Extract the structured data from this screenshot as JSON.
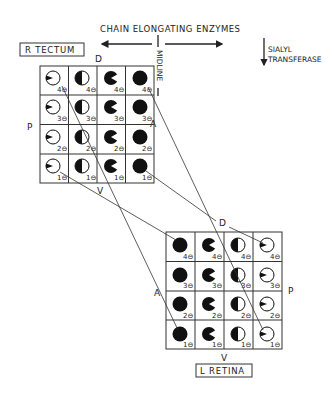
{
  "header": {
    "gradient_label": "CHAIN ELONGATING ENZYMES",
    "midline_label": "MIDLINE",
    "sialyl_label_line1": "SIALYL",
    "sialyl_label_line2": "TRANSFERASE"
  },
  "tectum": {
    "title": "R TECTUM",
    "axis_top": "D",
    "axis_left": "P",
    "axis_right": "A",
    "axis_bottom": "V",
    "rows": [
      "4⊖",
      "3⊖",
      "2⊖",
      "1⊖"
    ],
    "columns_fill": [
      "wedge-small",
      "half",
      "pacman",
      "full"
    ]
  },
  "retina": {
    "title": "L RETINA",
    "axis_top": "D",
    "axis_left": "A",
    "axis_right": "P",
    "axis_bottom": "V",
    "rows": [
      "4⊖",
      "3⊖",
      "2⊖",
      "1⊖"
    ],
    "columns_fill": [
      "full",
      "pacman",
      "half",
      "wedge-small"
    ]
  },
  "connections": [
    {
      "from": "tectum r4 c1",
      "to": "retina r1 c1"
    },
    {
      "from": "tectum r1 c1",
      "to": "retina r4 c1"
    },
    {
      "from": "tectum r4 c4",
      "to": "retina r1 c4"
    },
    {
      "from": "tectum r1 c4",
      "to": "retina r4 c4"
    }
  ]
}
